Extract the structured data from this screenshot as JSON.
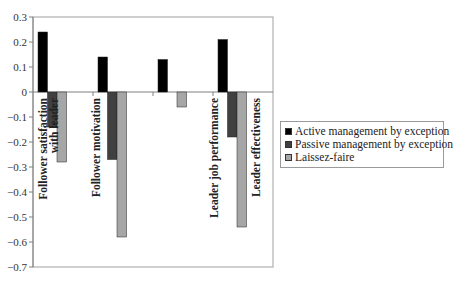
{
  "chart_data": {
    "type": "bar",
    "title": "",
    "xlabel": "",
    "ylabel": "",
    "categories": [
      "Follower satisfaction with leader",
      "Follower motivation",
      "Leader job performance",
      "Leader effectiveness"
    ],
    "category_label_lines": [
      [
        "Follower satisfaction",
        "with leader"
      ],
      [
        "Follower motivation"
      ],
      [
        "Leader job performance"
      ],
      [
        "Leader effectiveness"
      ]
    ],
    "series": [
      {
        "name": "Active management by exception",
        "color": "#000000",
        "values": [
          0.24,
          0.14,
          0.13,
          0.21
        ]
      },
      {
        "name": "Passive management by exception",
        "color": "#404040",
        "values": [
          -0.14,
          -0.27,
          null,
          -0.18
        ]
      },
      {
        "name": "Laissez-faire",
        "color": "#a6a6a6",
        "values": [
          -0.28,
          -0.58,
          -0.06,
          -0.54
        ]
      }
    ],
    "ylim": [
      -0.7,
      0.3
    ],
    "yticks": [
      0.3,
      0.2,
      0.1,
      0,
      -0.1,
      -0.2,
      -0.3,
      -0.4,
      -0.5,
      -0.6,
      -0.7
    ],
    "ytick_labels": [
      "0.3",
      "0.2",
      "0.1",
      "0",
      "−0.1",
      "−0.2",
      "−0.3",
      "−0.4",
      "−0.5",
      "−0.6",
      "−0.7"
    ],
    "grid": false,
    "legend_position": "right"
  },
  "legend": {
    "items": [
      {
        "label": "Active management by exception",
        "color": "#000000"
      },
      {
        "label": "Passive management by exception",
        "color": "#404040"
      },
      {
        "label": "Laissez-faire",
        "color": "#a6a6a6"
      }
    ]
  }
}
